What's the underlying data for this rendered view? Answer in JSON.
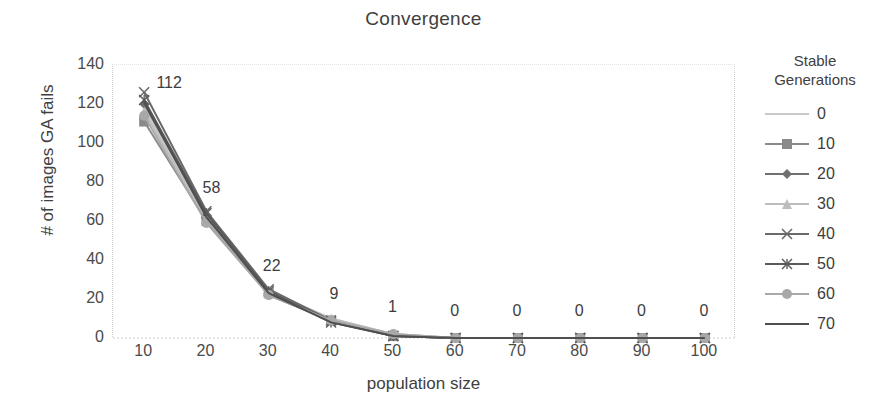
{
  "chart_data": {
    "type": "line",
    "title": "Convergence",
    "xlabel": "population size",
    "ylabel": "# of images GA fails",
    "x": [
      10,
      20,
      30,
      40,
      50,
      60,
      70,
      80,
      90,
      100
    ],
    "xlim": [
      5,
      105
    ],
    "ylim": [
      0,
      140
    ],
    "y_ticks": [
      140,
      120,
      100,
      80,
      60,
      40,
      20,
      0
    ],
    "x_ticks": [
      10,
      20,
      30,
      40,
      50,
      60,
      70,
      80,
      90,
      100
    ],
    "grid": false,
    "legend_position": "right",
    "legend_title": "Stable Generations",
    "data_labels": [
      112,
      58,
      22,
      9,
      1,
      0,
      0,
      0,
      0,
      0
    ],
    "series": [
      {
        "name": "0",
        "marker": "none",
        "color": "#c9c9c9",
        "values": [
          118,
          62,
          24,
          10,
          2,
          0,
          0,
          0,
          0,
          0
        ]
      },
      {
        "name": "10",
        "marker": "square",
        "color": "#8a8a8a",
        "values": [
          111,
          60,
          23,
          9,
          1,
          0,
          0,
          0,
          0,
          0
        ]
      },
      {
        "name": "20",
        "marker": "diamond",
        "color": "#707070",
        "values": [
          120,
          63,
          22,
          9,
          1,
          0,
          0,
          0,
          0,
          0
        ]
      },
      {
        "name": "30",
        "marker": "triangle",
        "color": "#bdbdbd",
        "values": [
          116,
          61,
          23,
          10,
          2,
          0,
          0,
          0,
          0,
          0
        ]
      },
      {
        "name": "40",
        "marker": "x",
        "color": "#6a6a6a",
        "values": [
          126,
          65,
          25,
          9,
          1,
          0,
          0,
          0,
          0,
          0
        ]
      },
      {
        "name": "50",
        "marker": "asterisk",
        "color": "#5a5a5a",
        "values": [
          122,
          64,
          24,
          8,
          1,
          0,
          0,
          0,
          0,
          0
        ]
      },
      {
        "name": "60",
        "marker": "circle",
        "color": "#a8a8a8",
        "values": [
          114,
          59,
          22,
          9,
          2,
          0,
          0,
          0,
          0,
          0
        ]
      },
      {
        "name": "70",
        "marker": "none",
        "color": "#4f4f4f",
        "values": [
          121,
          62,
          23,
          8,
          1,
          0,
          0,
          0,
          0,
          0
        ]
      }
    ]
  },
  "legend": {
    "title_line1": "Stable",
    "title_line2": "Generations",
    "items": [
      {
        "label": "0"
      },
      {
        "label": "10"
      },
      {
        "label": "20"
      },
      {
        "label": "30"
      },
      {
        "label": "40"
      },
      {
        "label": "50"
      },
      {
        "label": "60"
      },
      {
        "label": "70"
      }
    ]
  }
}
